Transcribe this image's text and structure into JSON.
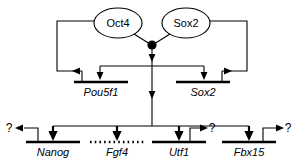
{
  "diagram": {
    "type": "gene-regulatory-network",
    "background_color": "#ffffff",
    "line_color": "#000000",
    "protein_nodes": [
      {
        "id": "oct4",
        "label": "Oct4",
        "shape": "ellipse",
        "cx": 118,
        "cy": 23
      },
      {
        "id": "sox2",
        "label": "Sox2",
        "shape": "ellipse",
        "cx": 186,
        "cy": 23
      }
    ],
    "hub": {
      "id": "oct4-sox2-complex",
      "shape": "filled-circle",
      "cx": 152,
      "cy": 45,
      "r": 4.6
    },
    "upper_genes": [
      {
        "id": "pou5f1",
        "label": "Pou5f1",
        "bar_style": "solid",
        "bar_x1": 74,
        "bar_x2": 128,
        "bar_y": 82,
        "label_x": 101,
        "label_y": 95
      },
      {
        "id": "sox2_gene",
        "label": "Sox2",
        "bar_style": "solid",
        "bar_x1": 176,
        "bar_x2": 230,
        "bar_y": 82,
        "label_x": 203,
        "label_y": 95
      }
    ],
    "lower_genes": [
      {
        "id": "nanog",
        "label": "Nanog",
        "bar_style": "solid",
        "bar_x1": 26,
        "bar_x2": 80,
        "bar_y": 142,
        "label_x": 53,
        "label_y": 155,
        "query": "?",
        "query_side": "left"
      },
      {
        "id": "fgf4",
        "label": "Fgf4",
        "bar_style": "dotted",
        "bar_x1": 90,
        "bar_x2": 144,
        "bar_y": 142,
        "label_x": 117,
        "label_y": 155,
        "query": "",
        "query_side": "none"
      },
      {
        "id": "utf1",
        "label": "Utf1",
        "bar_style": "solid",
        "bar_x1": 152,
        "bar_x2": 206,
        "bar_y": 142,
        "label_x": 179,
        "label_y": 155,
        "query": "?",
        "query_side": "right"
      },
      {
        "id": "fbx15",
        "label": "Fbx15",
        "bar_style": "solid",
        "bar_x1": 222,
        "bar_x2": 276,
        "bar_y": 142,
        "label_x": 249,
        "label_y": 155,
        "query": "?",
        "query_side": "right"
      }
    ],
    "query_marks": [
      {
        "id": "nanog-query",
        "text": "?",
        "x": 9,
        "y": 129
      },
      {
        "id": "utf1-query",
        "text": "?",
        "x": 212,
        "y": 129
      },
      {
        "id": "fbx15-query",
        "text": "?",
        "x": 288,
        "y": 129
      }
    ],
    "edges": [
      {
        "id": "oct4-to-hub",
        "from": "oct4",
        "to": "hub",
        "kind": "plain"
      },
      {
        "id": "sox2-to-hub",
        "from": "sox2",
        "to": "hub",
        "kind": "plain"
      },
      {
        "id": "oct4-feedback-to-pou5f1",
        "from": "oct4",
        "to": "pou5f1",
        "kind": "activation"
      },
      {
        "id": "sox2-feedback-to-sox2-gene",
        "from": "sox2",
        "to": "sox2_gene",
        "kind": "activation"
      },
      {
        "id": "hub-to-pou5f1",
        "from": "hub",
        "to": "pou5f1",
        "kind": "activation"
      },
      {
        "id": "hub-to-sox2-gene",
        "from": "hub",
        "to": "sox2_gene",
        "kind": "activation"
      },
      {
        "id": "hub-to-nanog",
        "from": "hub",
        "to": "nanog",
        "kind": "activation"
      },
      {
        "id": "hub-to-fgf4",
        "from": "hub",
        "to": "fgf4",
        "kind": "activation"
      },
      {
        "id": "hub-to-utf1",
        "from": "hub",
        "to": "utf1",
        "kind": "activation"
      },
      {
        "id": "hub-to-fbx15",
        "from": "hub",
        "to": "fbx15",
        "kind": "activation"
      }
    ]
  }
}
